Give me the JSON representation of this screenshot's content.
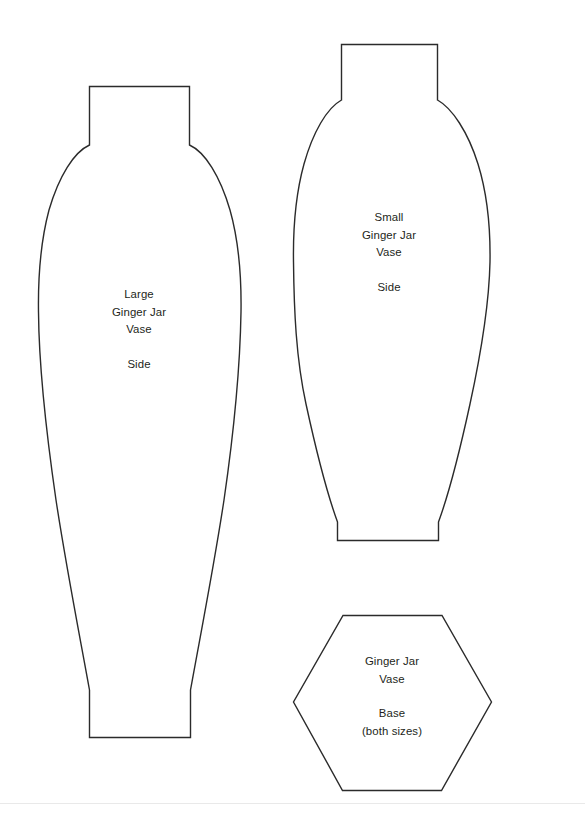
{
  "document": {
    "title": "Ginger Jar Vase Template",
    "background_color": "#ffffff",
    "outline_color": "#2b2b2b",
    "text_color": "#231f20"
  },
  "pieces": [
    {
      "id": "large-vase-side",
      "name": "Large Ginger Jar Vase Side",
      "label": {
        "line1": "Large",
        "line2": "Ginger Jar",
        "line3": "Vase",
        "line4": "Side"
      },
      "outline_path": "M 89.5 86.5 L 189.5 86.5 L 189.5 145 C 205 152 220 176 230 210 C 239 242 241.5 278 241 312 C 240 372 233 438 224 500 C 214 566 201 632 190.5 690 L 190.5 737.5 L 89.5 737.5 L 89.5 690 C 79 632 66 566 56 500 C 47 438 39 372 38.5 312 C 38 278 40.5 242 49 210 C 59 176 74 152 89.5 145 Z"
    },
    {
      "id": "small-vase-side",
      "name": "Small Ginger Jar Vase Side",
      "label": {
        "line1": "Small",
        "line2": "Ginger Jar",
        "line3": "Vase",
        "line4": "Side"
      },
      "outline_path": "M 341.5 44.5 L 437.5 44.5 L 437.5 100 C 452 108 468 132 478 164 C 487 193 490.5 230 490 262 C 489 310 480 358 470 404 C 460 450 448 496 438.5 522 L 438.5 540.5 L 337.5 540.5 L 337.5 522 C 328 496 316 450 306 404 C 296 358 294 310 293.5 262 C 293 230 296 193 304 164 C 313 132 327 108 341.5 100 Z"
    },
    {
      "id": "vase-base",
      "name": "Ginger Jar Vase Base (both sizes)",
      "label": {
        "line1": "Ginger Jar",
        "line2": "Vase",
        "line3": "Base",
        "line4": "(both sizes)"
      },
      "outline_path": "M 343 615.5 L 442 615.5 L 491.5 702 L 441.5 790.5 L 342.5 790.5 L 293.5 702 Z"
    }
  ]
}
